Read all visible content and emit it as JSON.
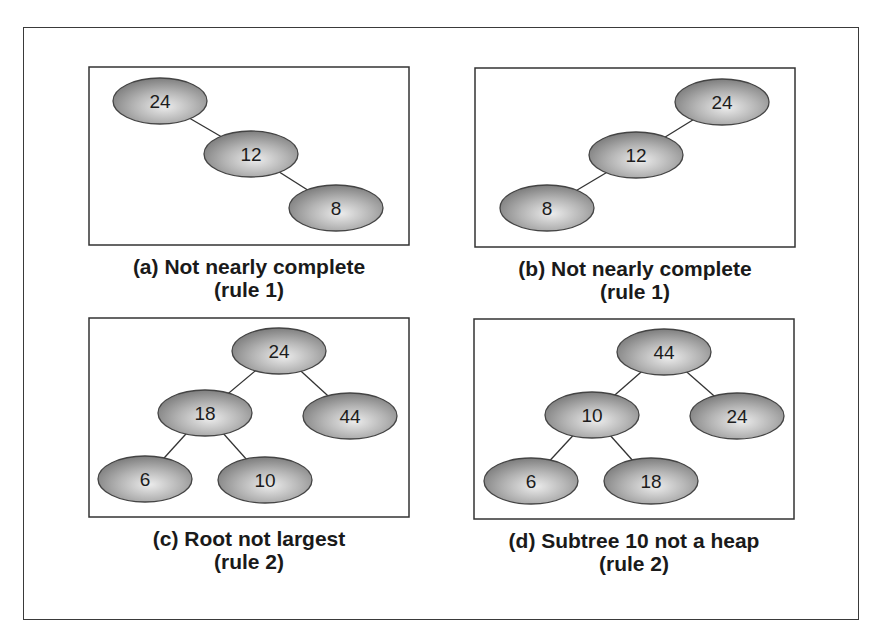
{
  "figure": {
    "panels": [
      {
        "id": "a",
        "caption_line1": "(a) Not nearly complete",
        "caption_line2": "(rule 1)",
        "box": {
          "x": 89,
          "y": 67,
          "w": 320,
          "h": 178
        },
        "nodes": [
          {
            "label": "24",
            "cx": 160,
            "cy": 101
          },
          {
            "label": "12",
            "cx": 251,
            "cy": 154
          },
          {
            "label": "8",
            "cx": 336,
            "cy": 208
          }
        ],
        "edges": [
          [
            0,
            1
          ],
          [
            1,
            2
          ]
        ]
      },
      {
        "id": "b",
        "caption_line1": "(b) Not nearly complete",
        "caption_line2": "(rule 1)",
        "box": {
          "x": 475,
          "y": 68,
          "w": 320,
          "h": 179
        },
        "nodes": [
          {
            "label": "24",
            "cx": 722,
            "cy": 102
          },
          {
            "label": "12",
            "cx": 636,
            "cy": 155
          },
          {
            "label": "8",
            "cx": 547,
            "cy": 208
          }
        ],
        "edges": [
          [
            0,
            1
          ],
          [
            1,
            2
          ]
        ]
      },
      {
        "id": "c",
        "caption_line1": "(c) Root not largest",
        "caption_line2": "(rule 2)",
        "box": {
          "x": 89,
          "y": 318,
          "w": 320,
          "h": 199
        },
        "nodes": [
          {
            "label": "24",
            "cx": 279,
            "cy": 351
          },
          {
            "label": "18",
            "cx": 205,
            "cy": 413
          },
          {
            "label": "44",
            "cx": 350,
            "cy": 416
          },
          {
            "label": "6",
            "cx": 145,
            "cy": 479
          },
          {
            "label": "10",
            "cx": 265,
            "cy": 480
          }
        ],
        "edges": [
          [
            0,
            1
          ],
          [
            0,
            2
          ],
          [
            1,
            3
          ],
          [
            1,
            4
          ]
        ]
      },
      {
        "id": "d",
        "caption_line1": "(d) Subtree 10 not a heap",
        "caption_line2": "(rule 2)",
        "box": {
          "x": 474,
          "y": 319,
          "w": 320,
          "h": 200
        },
        "nodes": [
          {
            "label": "44",
            "cx": 664,
            "cy": 352
          },
          {
            "label": "10",
            "cx": 592,
            "cy": 415
          },
          {
            "label": "24",
            "cx": 737,
            "cy": 416
          },
          {
            "label": "6",
            "cx": 531,
            "cy": 481
          },
          {
            "label": "18",
            "cx": 651,
            "cy": 481
          }
        ],
        "edges": [
          [
            0,
            1
          ],
          [
            0,
            2
          ],
          [
            1,
            3
          ],
          [
            1,
            4
          ]
        ]
      }
    ],
    "colors": {
      "node_center": "#e6e6e6",
      "node_edge": "#8a8a8a",
      "outline": "#333333",
      "line": "#333333"
    }
  }
}
